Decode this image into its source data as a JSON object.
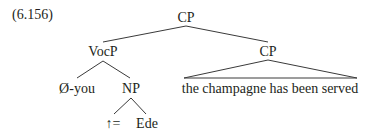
{
  "example_number": "(6.156)",
  "tree": {
    "root": "CP",
    "left_child": "VocP",
    "right_child": "CP",
    "vocp_children": [
      "Ø-you",
      "NP"
    ],
    "np_children": [
      "↑=",
      "Ede"
    ],
    "cp_triangle_text": "the champagne has been served"
  }
}
